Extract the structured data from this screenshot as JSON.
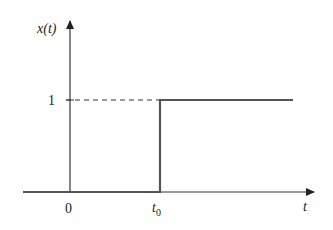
{
  "diagram": {
    "y_axis_label": "x(t)",
    "x_axis_label": "t",
    "y_tick_label": "1",
    "x_tick_origin": "0",
    "x_tick_shift_main": "t",
    "x_tick_shift_sub": "0",
    "colors": {
      "axis": "#222222",
      "signal": "#555555",
      "dashed": "#333333"
    }
  }
}
